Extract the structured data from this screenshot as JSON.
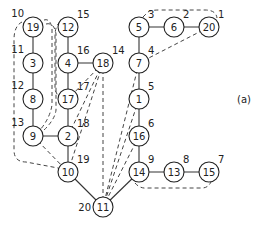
{
  "figure": {
    "caption": "(a)",
    "nodes": [
      {
        "id": "19",
        "label": "10",
        "x": 33,
        "y": 27
      },
      {
        "id": "3",
        "label": "11",
        "x": 33,
        "y": 63
      },
      {
        "id": "8",
        "label": "12",
        "x": 33,
        "y": 99
      },
      {
        "id": "9",
        "label": "13",
        "x": 33,
        "y": 136
      },
      {
        "id": "12",
        "label": "15",
        "x": 68,
        "y": 27
      },
      {
        "id": "4",
        "label": "16",
        "x": 68,
        "y": 63
      },
      {
        "id": "17",
        "label": "17",
        "x": 68,
        "y": 99
      },
      {
        "id": "2",
        "label": "18",
        "x": 68,
        "y": 136
      },
      {
        "id": "10",
        "label": "19",
        "x": 68,
        "y": 172
      },
      {
        "id": "18",
        "label": "14",
        "x": 103,
        "y": 63
      },
      {
        "id": "11",
        "label": "20",
        "x": 103,
        "y": 207
      },
      {
        "id": "5",
        "label": "3",
        "x": 139,
        "y": 27
      },
      {
        "id": "6",
        "label": "2",
        "x": 174,
        "y": 27
      },
      {
        "id": "20",
        "label": "1",
        "x": 209,
        "y": 27
      },
      {
        "id": "7",
        "label": "4",
        "x": 139,
        "y": 63
      },
      {
        "id": "1",
        "label": "5",
        "x": 139,
        "y": 99
      },
      {
        "id": "16",
        "label": "6",
        "x": 139,
        "y": 136
      },
      {
        "id": "14",
        "label": "9",
        "x": 139,
        "y": 172
      },
      {
        "id": "13",
        "label": "8",
        "x": 174,
        "y": 172
      },
      {
        "id": "15",
        "label": "7",
        "x": 209,
        "y": 172
      }
    ],
    "solid_edges": [
      [
        "19",
        "3"
      ],
      [
        "3",
        "8"
      ],
      [
        "8",
        "9"
      ],
      [
        "9",
        "2"
      ],
      [
        "12",
        "4"
      ],
      [
        "4",
        "17"
      ],
      [
        "17",
        "2"
      ],
      [
        "2",
        "10"
      ],
      [
        "4",
        "18"
      ],
      [
        "10",
        "11"
      ],
      [
        "14",
        "11"
      ],
      [
        "5",
        "6"
      ],
      [
        "6",
        "20"
      ],
      [
        "5",
        "7"
      ],
      [
        "7",
        "1"
      ],
      [
        "1",
        "16"
      ],
      [
        "16",
        "14"
      ],
      [
        "14",
        "13"
      ],
      [
        "13",
        "15"
      ]
    ],
    "dashed_edges": [
      [
        "18",
        "17"
      ],
      [
        "18",
        "2"
      ],
      [
        "18",
        "10"
      ],
      [
        "18",
        "11"
      ],
      [
        "7",
        "11"
      ],
      [
        "1",
        "11"
      ],
      [
        "16",
        "11"
      ],
      [
        "20",
        "7"
      ],
      [
        "9",
        "10"
      ]
    ]
  }
}
